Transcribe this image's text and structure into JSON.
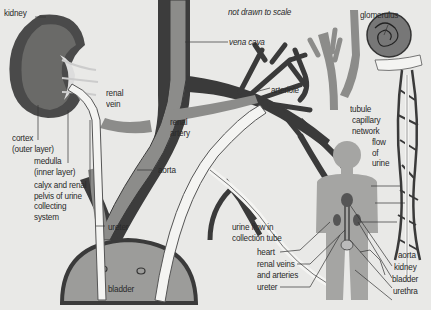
{
  "title_note": "not drawn to scale",
  "colors": {
    "background": "#e9e9e7",
    "vein_dark": "#3a3a3a",
    "artery_mid": "#8a8a8a",
    "ureter_light": "#f2f2f0",
    "bladder": "#9c9c9a",
    "body": "#a5a5a3",
    "kidney": "#4a4a4a"
  },
  "labels": {
    "kidney": "kidney",
    "renal_vein": "renal\nvein",
    "vena_cava": "vena cava",
    "not_to_scale": "not drawn to scale",
    "cortex": "cortex\n(outer layer)",
    "medulla": "medulla\n(inner layer)",
    "calyx": "calyx and renal\npelvis of urine\ncollecting\nsystem",
    "renal_artery": "renal\nartery",
    "aorta_main": "aorta",
    "ureter_main": "ureter",
    "bladder_main": "bladder",
    "arteriole": "arteriole",
    "glomerulus": "glomerulus",
    "tubule": "tubule",
    "capillary_network": "capillary\nnetwork",
    "flow_of_urine": "flow\nof\nurine",
    "urine_flow_collection": "urine flow in\ncollection tube",
    "heart": "heart",
    "renal_veins_arteries": "renal veins\nand arteries",
    "ureter_body": "ureter",
    "aorta_body": "aorta",
    "kidney_body": "kidney",
    "bladder_body": "bladder",
    "urethra": "urethra"
  }
}
